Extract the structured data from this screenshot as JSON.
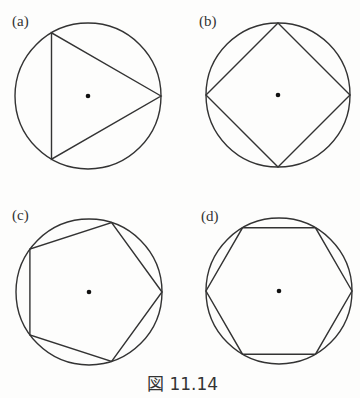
{
  "figure": {
    "caption": "図 11.14",
    "panels": [
      {
        "label": "(a)",
        "polygon": "triangle",
        "sides": 3,
        "center": [
          88,
          96
        ],
        "radius": 73,
        "start_angle_deg": 0
      },
      {
        "label": "(b)",
        "polygon": "square",
        "sides": 4,
        "center": [
          278,
          95
        ],
        "radius": 72,
        "start_angle_deg": 0
      },
      {
        "label": "(c)",
        "polygon": "pentagon",
        "sides": 5,
        "center": [
          89,
          292
        ],
        "radius": 73,
        "start_angle_deg": 0
      },
      {
        "label": "(d)",
        "polygon": "hexagon",
        "sides": 6,
        "center": [
          279,
          291
        ],
        "radius": 73,
        "start_angle_deg": 0
      }
    ]
  }
}
